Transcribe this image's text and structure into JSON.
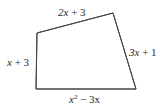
{
  "figure": {
    "type": "quadrilateral",
    "side_labels": {
      "top": {
        "var": "2x",
        "rest": " + 3"
      },
      "right": {
        "var": "3x",
        "rest": " + 1"
      },
      "left": {
        "var": "x",
        "rest": " + 3"
      },
      "bottom": {
        "var": "x",
        "sup": "2",
        "rest": " − 3x"
      }
    },
    "colors": {
      "stroke": "#444444",
      "text": "#2a2a2a"
    }
  }
}
